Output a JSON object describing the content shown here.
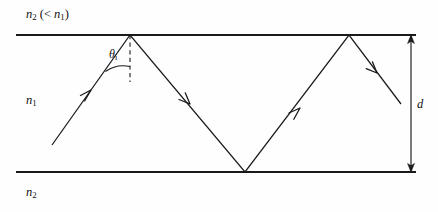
{
  "figure": {
    "background_color": "#fefefe",
    "line_color": "#1a1a1a",
    "labels": {
      "cladding_top": {
        "symbol": "n",
        "subscript": "2",
        "relation": "(< n1)",
        "text": "n2 (< n1)"
      },
      "core": {
        "symbol": "n",
        "subscript": "1",
        "text": "n1"
      },
      "cladding_bottom": {
        "symbol": "n",
        "subscript": "2",
        "text": "n2"
      },
      "incidence_angle": {
        "symbol": "θ",
        "subscript": "i",
        "text": "θi"
      },
      "thickness": {
        "symbol": "d",
        "text": "d"
      }
    }
  },
  "chart_data": {
    "type": "line",
    "xlabel": "",
    "ylabel": "",
    "xlim": [
      0,
      438
    ],
    "ylim": [
      212,
      0
    ],
    "grid": false,
    "legend": "none",
    "annotations": [
      {
        "name": "cladding-top-label",
        "text": "n2 (< n1)",
        "x": 26,
        "y": 14
      },
      {
        "name": "core-label",
        "text": "n1",
        "x": 26,
        "y": 100
      },
      {
        "name": "cladding-bottom-label",
        "text": "n2",
        "x": 26,
        "y": 192
      },
      {
        "name": "angle-label",
        "text": "θi",
        "x": 113,
        "y": 56
      },
      {
        "name": "thickness-label",
        "text": "d",
        "x": 420,
        "y": 104
      }
    ],
    "series": [
      {
        "name": "top-boundary",
        "kind": "boundary-line",
        "x": [
          16,
          416
        ],
        "y": [
          35,
          35
        ]
      },
      {
        "name": "bottom-boundary",
        "kind": "boundary-line",
        "x": [
          16,
          416
        ],
        "y": [
          172,
          172
        ]
      },
      {
        "name": "ray-path",
        "kind": "zigzag-ray",
        "x": [
          52,
          130,
          245,
          349,
          401
        ],
        "y": [
          145,
          35,
          172,
          35,
          104
        ]
      },
      {
        "name": "normal-line",
        "kind": "dashed-normal",
        "x": [
          130,
          130
        ],
        "y": [
          35,
          82
        ]
      },
      {
        "name": "thickness-arrow",
        "kind": "double-arrow",
        "x": [
          411,
          411
        ],
        "y": [
          35,
          172
        ]
      }
    ],
    "ray_arrow_markers": [
      {
        "name": "incoming-arrow",
        "x": 91,
        "y": 90,
        "angle_deg": -54.6
      },
      {
        "name": "first-reflected-arrow",
        "x": 190,
        "y": 104,
        "angle_deg": 48.8
      },
      {
        "name": "second-reflected-arrow",
        "x": 300,
        "y": 108,
        "angle_deg": -52.7
      },
      {
        "name": "outgoing-arrow",
        "x": 377,
        "y": 73,
        "angle_deg": 52.9
      }
    ]
  }
}
